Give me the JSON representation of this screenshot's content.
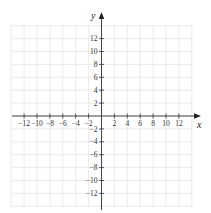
{
  "diagram": {
    "type": "cartesian-coordinate-grid",
    "x_axis": {
      "label": "x",
      "range": [
        -14,
        14
      ],
      "ticks": [
        -12,
        -10,
        -8,
        -6,
        -4,
        -2,
        2,
        4,
        6,
        8,
        10,
        12
      ],
      "tick_labels": [
        "−12",
        "−10",
        "−8",
        "−6",
        "−4",
        "−2",
        "2",
        "4",
        "6",
        "8",
        "10",
        "12"
      ]
    },
    "y_axis": {
      "label": "y",
      "range": [
        -14,
        14
      ],
      "ticks": [
        12,
        10,
        8,
        6,
        4,
        2,
        -2,
        -4,
        -6,
        -8,
        -10,
        -12
      ],
      "tick_labels": [
        "12",
        "10",
        "8",
        "6",
        "4",
        "2",
        "−2",
        "−4",
        "−6",
        "−8",
        "−10",
        "−12"
      ]
    },
    "grid": {
      "step": 2,
      "visible": true
    },
    "colors": {
      "grid": "#dcdcdc",
      "axis": "#333333",
      "background": "#ffffff"
    }
  }
}
